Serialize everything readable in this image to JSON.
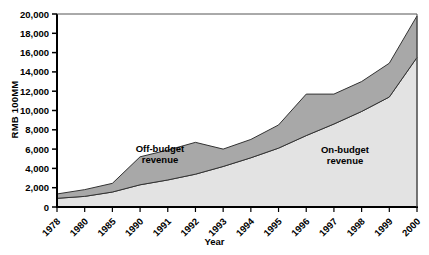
{
  "chart_data": {
    "type": "area",
    "title": "",
    "xlabel": "Year",
    "ylabel": "RMB 100MM",
    "categories": [
      "1978",
      "1980",
      "1985",
      "1990",
      "1991",
      "1992",
      "1993",
      "1994",
      "1995",
      "1996",
      "1997",
      "1998",
      "1999",
      "2000"
    ],
    "ylim": [
      0,
      20000
    ],
    "ytick_labels": [
      "0",
      "2,000",
      "4,000",
      "6,000",
      "8,000",
      "10,000",
      "12,000",
      "14,000",
      "16,000",
      "18,000",
      "20,000"
    ],
    "ytick_values": [
      0,
      2000,
      4000,
      6000,
      8000,
      10000,
      12000,
      14000,
      16000,
      18000,
      20000
    ],
    "grid": false,
    "stacked": true,
    "legend_position": "inline-annotation",
    "series": [
      {
        "name": "On-budget revenue",
        "color": "#e3e3e3",
        "values": [
          900,
          1100,
          1550,
          2300,
          2800,
          3400,
          4200,
          5100,
          6100,
          7400,
          8600,
          9900,
          11400,
          15500
        ]
      },
      {
        "name": "Off-budget revenue",
        "color": "#a8a8a8",
        "values": [
          450,
          700,
          900,
          2900,
          3100,
          3300,
          1800,
          1900,
          2400,
          4300,
          3100,
          3100,
          3500,
          4300
        ]
      }
    ],
    "totals": [
      1350,
      1800,
      2450,
      5200,
      5900,
      6700,
      6000,
      7000,
      8500,
      11700,
      11700,
      13000,
      14900,
      19800
    ],
    "annotations": [
      {
        "name": "off-budget-label",
        "line1": "Off-budget",
        "line2": "revenue",
        "x_px": 160,
        "y_px": 152
      },
      {
        "name": "on-budget-label",
        "line1": "On-budget",
        "line2": "revenue",
        "x_px": 345,
        "y_px": 153
      }
    ]
  }
}
